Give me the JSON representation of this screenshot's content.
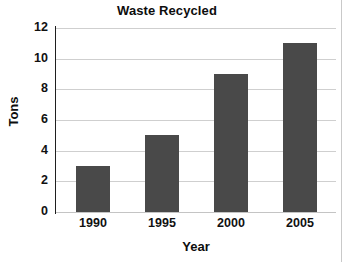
{
  "chart_data": {
    "type": "bar",
    "title": "Waste Recycled",
    "xlabel": "Year",
    "ylabel": "Tons",
    "categories": [
      "1990",
      "1995",
      "2000",
      "2005"
    ],
    "values": [
      3,
      5,
      9,
      11
    ],
    "ylim": [
      0,
      12
    ],
    "ytick_labels": [
      "0",
      "2",
      "4",
      "6",
      "8",
      "10",
      "12"
    ],
    "ytick_values": [
      0,
      2,
      4,
      6,
      8,
      10,
      12
    ],
    "grid": "horizontal",
    "legend": "none",
    "series": [
      {
        "name": "Tons",
        "color": "#494949",
        "values": [
          3,
          5,
          9,
          11
        ]
      }
    ]
  },
  "colors": {
    "bar": "#494949",
    "gridline": "#cfcfcf",
    "axis": "#1f1f1f",
    "text": "#111111",
    "background": "#ffffff"
  }
}
